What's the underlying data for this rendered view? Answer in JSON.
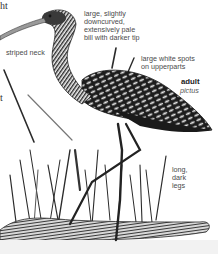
{
  "illustration": {
    "subject": "Limpkin",
    "cut_text_top_left": "ht",
    "cut_text_left_mid": "t",
    "labels": {
      "bill": [
        "large, slightly",
        "downcurved,",
        "extensively pale",
        "bill with darker tip"
      ],
      "neck": "striped neck",
      "upperparts": [
        "large white spots",
        "on upperparts"
      ],
      "age": "adult",
      "subspecies": "pictus",
      "legs": [
        "long,",
        "dark",
        "legs"
      ]
    },
    "colors": {
      "background": "#ffffff",
      "ink": "#1a1a1a",
      "label": "#4a4a4a"
    }
  }
}
